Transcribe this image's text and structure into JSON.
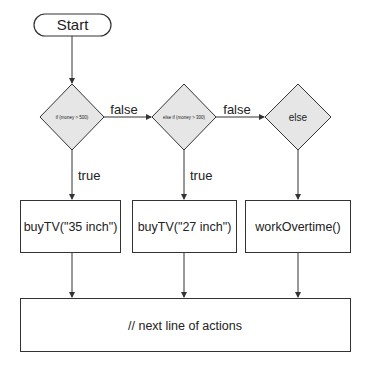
{
  "diagram": {
    "type": "flowchart",
    "start": {
      "label": "Start"
    },
    "decisions": [
      {
        "label": "if (money > 500)"
      },
      {
        "label": "else if (money > 300)"
      },
      {
        "label": "else"
      }
    ],
    "edge_labels": {
      "false_1": "false",
      "false_2": "false",
      "true_1": "true",
      "true_2": "true"
    },
    "actions": [
      {
        "label": "buyTV(\"35 inch\")"
      },
      {
        "label": "buyTV(\"27 inch\")"
      },
      {
        "label": "workOvertime()"
      }
    ],
    "end": {
      "label": "// next line of actions"
    },
    "colors": {
      "stroke": "#333333",
      "diamond_fill": "#e6e6e6",
      "box_fill": "#ffffff"
    }
  }
}
